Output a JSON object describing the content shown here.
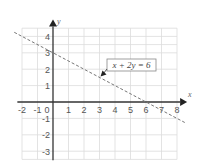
{
  "chart_data": {
    "type": "line",
    "title": "",
    "xlabel": "x",
    "ylabel": "y",
    "xlim": [
      -2,
      8
    ],
    "ylim": [
      -3.5,
      4.5
    ],
    "grid": true,
    "x_ticks": [
      "-2",
      "-1",
      "0",
      "1",
      "2",
      "3",
      "4",
      "5",
      "6",
      "7",
      "8"
    ],
    "y_ticks": [
      "4",
      "3",
      "2",
      "1",
      "-1",
      "-2",
      "-3"
    ],
    "series": [
      {
        "name": "x + 2y = 6",
        "style": "dashed",
        "x": [
          -2.5,
          8.5
        ],
        "y": [
          4.25,
          -1.25
        ],
        "intercepts": {
          "x": 6,
          "y": 3
        }
      }
    ],
    "annotations": [
      {
        "text": "x + 2y = 6",
        "points_to": [
          3,
          1.5
        ]
      }
    ]
  },
  "colors": {
    "grid": "#dcdcdc",
    "axis": "#333333",
    "line": "#777777",
    "label_border": "#888888"
  }
}
